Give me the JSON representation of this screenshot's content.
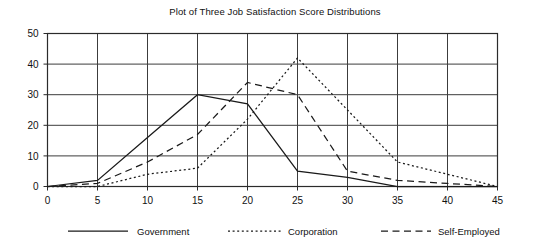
{
  "chart_data": {
    "type": "line",
    "title": "Plot of Three Job Satisfaction Score Distributions",
    "xlabel": "",
    "ylabel": "",
    "xlim": [
      0,
      45
    ],
    "ylim": [
      0,
      50
    ],
    "xticks": [
      0,
      5,
      10,
      15,
      20,
      25,
      30,
      35,
      40,
      45
    ],
    "yticks": [
      0,
      10,
      20,
      30,
      40,
      50
    ],
    "grid": true,
    "legend_position": "bottom",
    "series": [
      {
        "name": "Government",
        "style": "solid",
        "color": "#1a1a1a",
        "x": [
          0,
          5,
          10,
          15,
          20,
          25,
          30,
          35,
          40,
          45
        ],
        "y": [
          0,
          2,
          16,
          30,
          27,
          5,
          3,
          0,
          0,
          0
        ]
      },
      {
        "name": "Corporation",
        "style": "dotted",
        "color": "#1a1a1a",
        "x": [
          0,
          5,
          10,
          15,
          20,
          25,
          30,
          35,
          40,
          45
        ],
        "y": [
          0,
          0,
          4,
          6,
          22,
          42,
          25,
          8,
          4,
          0
        ]
      },
      {
        "name": "Self-Employed",
        "style": "dashed",
        "color": "#1a1a1a",
        "x": [
          0,
          5,
          10,
          15,
          20,
          25,
          30,
          35,
          40,
          45
        ],
        "y": [
          0,
          1,
          8,
          17,
          34,
          30,
          5,
          2,
          1,
          0
        ]
      }
    ]
  },
  "legend": {
    "items": [
      {
        "label": "Government",
        "style": "solid"
      },
      {
        "label": "Corporation",
        "style": "dotted"
      },
      {
        "label": "Self-Employed",
        "style": "dashed"
      }
    ]
  },
  "colors": {
    "ink": "#1a1a1a",
    "grid": "#3c3c3c",
    "frame": "#2b2b2b",
    "background": "#ffffff"
  }
}
